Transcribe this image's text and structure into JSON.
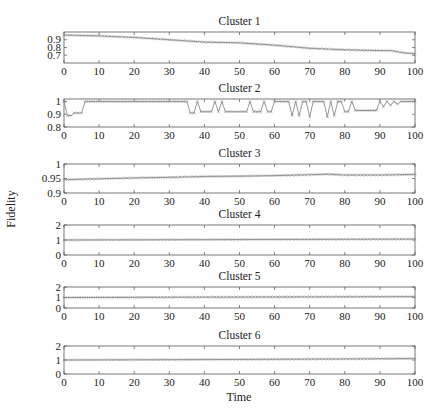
{
  "figure": {
    "ylabel": "Fidelity",
    "xlabel": "Time",
    "line_color": "#8c8c8c",
    "marker": "x",
    "frame_color": "#555555"
  },
  "chart_data": [
    {
      "type": "line",
      "title": "Cluster 1",
      "xlabel": "",
      "ylabel": "",
      "xlim": [
        0,
        100
      ],
      "ylim": [
        0.6,
        1.0
      ],
      "xticks": [
        0,
        10,
        20,
        30,
        40,
        50,
        60,
        70,
        80,
        90,
        100
      ],
      "yticks": [
        0.7,
        0.8,
        0.9
      ],
      "ytick_labels": [
        "0.7",
        "0.8",
        "0.9"
      ],
      "keypoints": {
        "x": [
          0,
          10,
          20,
          30,
          40,
          50,
          60,
          70,
          80,
          90,
          93,
          97,
          100
        ],
        "y": [
          0.96,
          0.95,
          0.93,
          0.9,
          0.87,
          0.86,
          0.83,
          0.79,
          0.77,
          0.76,
          0.76,
          0.73,
          0.72
        ]
      },
      "box": {
        "top": 32,
        "bottom": 63
      }
    },
    {
      "type": "line",
      "title": "Cluster 2",
      "xlabel": "",
      "ylabel": "",
      "xlim": [
        0,
        100
      ],
      "ylim": [
        0.8,
        1.02
      ],
      "xticks": [
        0,
        10,
        20,
        30,
        40,
        50,
        60,
        70,
        80,
        90,
        100
      ],
      "yticks": [
        0.8,
        0.9,
        1.0
      ],
      "ytick_labels": [
        "0.8",
        "0.9",
        "1"
      ],
      "description": "Mostly 1.0 with intermittent dips to ~0.88-0.93 around t=1-5, 36-58, 64-82 and small oscillations 89-100",
      "dips": [
        [
          1,
          2,
          0.89
        ],
        [
          3,
          5,
          0.91
        ],
        [
          36,
          37,
          0.91
        ],
        [
          39,
          42,
          0.92
        ],
        [
          44,
          44,
          0.92
        ],
        [
          46,
          52,
          0.92
        ],
        [
          54,
          56,
          0.92
        ],
        [
          58,
          59,
          0.92
        ],
        [
          65,
          65,
          0.89
        ],
        [
          67,
          67,
          0.89
        ],
        [
          70,
          70,
          0.88
        ],
        [
          75,
          75,
          0.88
        ],
        [
          77,
          77,
          0.89
        ],
        [
          80,
          81,
          0.92
        ],
        [
          83,
          89,
          0.93
        ],
        [
          91,
          91,
          0.96
        ],
        [
          93,
          93,
          0.97
        ],
        [
          95,
          95,
          0.98
        ]
      ],
      "box": {
        "top": 99,
        "bottom": 127
      }
    },
    {
      "type": "line",
      "title": "Cluster 3",
      "xlabel": "",
      "ylabel": "Fidelity",
      "xlim": [
        0,
        100
      ],
      "ylim": [
        0.9,
        1.0
      ],
      "xticks": [
        0,
        10,
        20,
        30,
        40,
        50,
        60,
        70,
        80,
        90,
        100
      ],
      "yticks": [
        0.9,
        0.95,
        1.0
      ],
      "ytick_labels": [
        "0.9",
        "0.95",
        "1"
      ],
      "keypoints": {
        "x": [
          0,
          10,
          20,
          30,
          40,
          50,
          60,
          70,
          75,
          80,
          90,
          100
        ],
        "y": [
          0.946,
          0.949,
          0.952,
          0.954,
          0.957,
          0.958,
          0.96,
          0.963,
          0.965,
          0.962,
          0.962,
          0.964
        ]
      },
      "box": {
        "top": 164,
        "bottom": 193
      }
    },
    {
      "type": "line",
      "title": "Cluster 4",
      "xlabel": "",
      "ylabel": "",
      "xlim": [
        0,
        100
      ],
      "ylim": [
        0,
        2
      ],
      "xticks": [
        0,
        10,
        20,
        30,
        40,
        50,
        60,
        70,
        80,
        90,
        100
      ],
      "yticks": [
        0,
        1,
        2
      ],
      "ytick_labels": [
        "0",
        "1",
        "2"
      ],
      "keypoints": {
        "x": [
          0,
          50,
          100
        ],
        "y": [
          1.0,
          1.03,
          1.06
        ]
      },
      "box": {
        "top": 225,
        "bottom": 255
      }
    },
    {
      "type": "line",
      "title": "Cluster 5",
      "xlabel": "",
      "ylabel": "",
      "xlim": [
        0,
        100
      ],
      "ylim": [
        0,
        2
      ],
      "xticks": [
        0,
        10,
        20,
        30,
        40,
        50,
        60,
        70,
        80,
        90,
        100
      ],
      "yticks": [
        0,
        1,
        2
      ],
      "ytick_labels": [
        "0",
        "1",
        "2"
      ],
      "keypoints": {
        "x": [
          0,
          50,
          100
        ],
        "y": [
          1.0,
          1.04,
          1.08
        ]
      },
      "box": {
        "top": 287,
        "bottom": 308
      }
    },
    {
      "type": "line",
      "title": "Cluster 6",
      "xlabel": "Time",
      "ylabel": "",
      "xlim": [
        0,
        100
      ],
      "ylim": [
        0,
        2
      ],
      "xticks": [
        0,
        10,
        20,
        30,
        40,
        50,
        60,
        70,
        80,
        90,
        100
      ],
      "yticks": [
        0,
        1,
        2
      ],
      "ytick_labels": [
        "0",
        "1",
        "2"
      ],
      "keypoints": {
        "x": [
          0,
          50,
          100
        ],
        "y": [
          1.0,
          1.04,
          1.1
        ]
      },
      "box": {
        "top": 346,
        "bottom": 374
      }
    }
  ]
}
